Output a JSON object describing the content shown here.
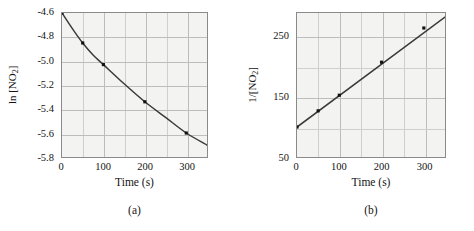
{
  "figure": {
    "background": "#ffffff",
    "plot_background": "#f3f3f1",
    "frame_color": "#8a8a8a",
    "grid_color": "#cfcfcf",
    "curve_color": "#3a3a3a",
    "marker_color": "#111111"
  },
  "panels": [
    {
      "id": "a",
      "caption": "(a)",
      "ylabel_pre": "ln [NO",
      "ylabel_sub": "2",
      "ylabel_post": "]",
      "xlabel": "Time (s)",
      "yticks": [
        "-4.6",
        "-4.8",
        "-5.0",
        "-5.2",
        "-5.4",
        "-5.6",
        "-5.8"
      ],
      "xticks": [
        "0",
        "100",
        "200",
        "300"
      ]
    },
    {
      "id": "b",
      "caption": "(b)",
      "ylabel_pre": "1/[NO",
      "ylabel_sub": "2",
      "ylabel_post": "]",
      "xlabel": "Time (s)",
      "yticks": [
        "250",
        "150",
        "50"
      ],
      "xticks": [
        "0",
        "100",
        "200",
        "300"
      ]
    }
  ],
  "chart_data": [
    {
      "type": "scatter",
      "panel": "a",
      "title": "",
      "xlabel": "Time (s)",
      "ylabel": "ln [NO2]",
      "xlim": [
        0,
        350
      ],
      "ylim": [
        -5.8,
        -4.6
      ],
      "xticks": [
        0,
        100,
        200,
        300
      ],
      "yticks": [
        -5.8,
        -5.6,
        -5.4,
        -5.2,
        -5.0,
        -4.8,
        -4.6
      ],
      "grid": true,
      "legend": "none",
      "fit": "curved",
      "x": [
        0,
        50,
        100,
        200,
        300
      ],
      "y": [
        -4.6,
        -4.85,
        -5.03,
        -5.34,
        -5.6
      ],
      "curve_x": [
        0,
        25,
        50,
        75,
        100,
        150,
        200,
        250,
        300,
        350
      ],
      "curve_y": [
        -4.6,
        -4.73,
        -4.85,
        -4.95,
        -5.03,
        -5.19,
        -5.34,
        -5.47,
        -5.6,
        -5.7
      ]
    },
    {
      "type": "scatter",
      "panel": "b",
      "title": "",
      "xlabel": "Time (s)",
      "ylabel": "1/[NO2]",
      "xlim": [
        0,
        350
      ],
      "ylim": [
        50,
        290
      ],
      "xticks": [
        0,
        100,
        200,
        300
      ],
      "yticks": [
        50,
        150,
        250
      ],
      "minor_yticks": [
        100,
        200
      ],
      "grid": true,
      "legend": "none",
      "fit": "linear",
      "x": [
        0,
        50,
        100,
        200,
        300
      ],
      "y": [
        100,
        127,
        153,
        208,
        265
      ],
      "line_x": [
        0,
        350
      ],
      "line_y": [
        100,
        283
      ]
    }
  ]
}
